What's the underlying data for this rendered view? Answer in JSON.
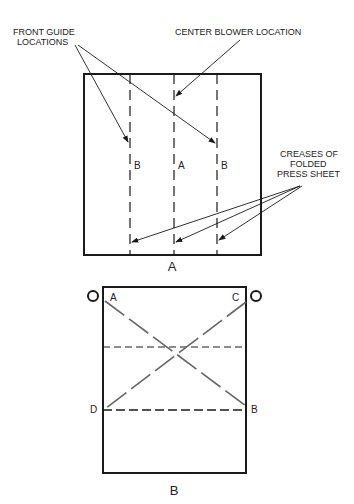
{
  "figure_a": {
    "caption": "A",
    "labels": {
      "front_guide_line1": "FRONT GUIDE",
      "front_guide_line2": "LOCATIONS",
      "center_blower": "CENTER BLOWER LOCATION",
      "creases_line1": "CREASES OF",
      "creases_line2": "FOLDED",
      "creases_line3": "PRESS SHEET"
    },
    "crease_labels": [
      "B",
      "A",
      "B"
    ]
  },
  "figure_b": {
    "caption": "B",
    "corner_labels": {
      "top_left": "A",
      "top_right": "C",
      "bottom_left": "D",
      "bottom_right": "B"
    }
  },
  "colors": {
    "line": "#1a1a1a",
    "gray_line": "#666666",
    "text": "#222222"
  }
}
